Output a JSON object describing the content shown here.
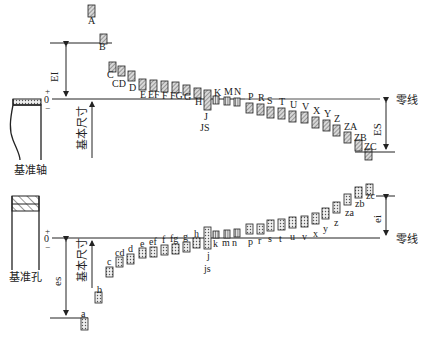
{
  "top": {
    "axis_label": "基准轴",
    "zero_line_label": "零线",
    "basic_size_label": "基本尺寸",
    "plus": "+",
    "zero": "0",
    "minus": "−",
    "EI_label": "EI",
    "ES_label": "ES",
    "hole_letters": [
      {
        "t": "A",
        "x": 88,
        "y": 5,
        "h": 12,
        "lx": 88,
        "ly": 24
      },
      {
        "t": "B",
        "x": 100,
        "y": 34,
        "h": 10,
        "lx": 99,
        "ly": 50
      },
      {
        "t": "C",
        "x": 109,
        "y": 62,
        "h": 10,
        "lx": 107,
        "ly": 78
      },
      {
        "t": "CD",
        "x": 118,
        "y": 66,
        "h": 10,
        "lx": 112,
        "ly": 87
      },
      {
        "t": "D",
        "x": 128,
        "y": 71,
        "h": 10,
        "lx": 129,
        "ly": 91
      },
      {
        "t": "E",
        "x": 139,
        "y": 79,
        "h": 11,
        "lx": 140,
        "ly": 98
      },
      {
        "t": "EF",
        "x": 150,
        "y": 80,
        "h": 11,
        "lx": 148,
        "ly": 98
      },
      {
        "t": "F",
        "x": 161,
        "y": 81,
        "h": 11,
        "lx": 162,
        "ly": 99
      },
      {
        "t": "FG",
        "x": 172,
        "y": 82,
        "h": 11,
        "lx": 170,
        "ly": 99
      },
      {
        "t": "G",
        "x": 183,
        "y": 85,
        "h": 10,
        "lx": 184,
        "ly": 100
      },
      {
        "t": "H",
        "x": 194,
        "y": 88,
        "h": 10,
        "lx": 195,
        "ly": 105
      }
    ],
    "J_label": "J",
    "JS_label": "JS",
    "K_label": "K",
    "M_label": "M",
    "N_label": "N",
    "right_letters": [
      {
        "t": "P",
        "x": 246,
        "y": 103,
        "h": 10,
        "lx": 248,
        "ly": 100
      },
      {
        "t": "R",
        "x": 257,
        "y": 104,
        "h": 11,
        "lx": 258,
        "ly": 101
      },
      {
        "t": "S",
        "x": 267,
        "y": 107,
        "h": 11,
        "lx": 267,
        "ly": 104
      },
      {
        "t": "T",
        "x": 278,
        "y": 108,
        "h": 11,
        "lx": 279,
        "ly": 105
      },
      {
        "t": "U",
        "x": 289,
        "y": 111,
        "h": 11,
        "lx": 290,
        "ly": 108
      },
      {
        "t": "V",
        "x": 301,
        "y": 112,
        "h": 11,
        "lx": 302,
        "ly": 110
      },
      {
        "t": "X",
        "x": 312,
        "y": 117,
        "h": 11,
        "lx": 313,
        "ly": 114
      },
      {
        "t": "Y",
        "x": 323,
        "y": 120,
        "h": 11,
        "lx": 324,
        "ly": 117
      },
      {
        "t": "Z",
        "x": 333,
        "y": 125,
        "h": 11,
        "lx": 334,
        "ly": 122
      },
      {
        "t": "ZA",
        "x": 344,
        "y": 132,
        "h": 11,
        "lx": 344,
        "ly": 130
      },
      {
        "t": "ZB",
        "x": 355,
        "y": 140,
        "h": 11,
        "lx": 354,
        "ly": 141
      },
      {
        "t": "ZC",
        "x": 365,
        "y": 149,
        "h": 11,
        "lx": 364,
        "ly": 150
      }
    ]
  },
  "bottom": {
    "axis_label": "基准孔",
    "zero_line_label": "零线",
    "basic_size_label": "基本尺寸",
    "plus": "+",
    "zero": "0",
    "minus": "−",
    "es_label": "es",
    "ei_label": "ei",
    "shaft_letters": [
      {
        "t": "a",
        "x": 81,
        "y": 318,
        "h": 12,
        "lx": 81,
        "ly": 317
      },
      {
        "t": "b",
        "x": 95,
        "y": 292,
        "h": 11,
        "lx": 97,
        "ly": 293
      },
      {
        "t": "c",
        "x": 106,
        "y": 267,
        "h": 10,
        "lx": 107,
        "ly": 265
      },
      {
        "t": "cd",
        "x": 116,
        "y": 257,
        "h": 10,
        "lx": 115,
        "ly": 256
      },
      {
        "t": "d",
        "x": 127,
        "y": 254,
        "h": 10,
        "lx": 128,
        "ly": 252
      },
      {
        "t": "e",
        "x": 139,
        "y": 248,
        "h": 10,
        "lx": 140,
        "ly": 247
      },
      {
        "t": "ef",
        "x": 150,
        "y": 247,
        "h": 10,
        "lx": 149,
        "ly": 245
      },
      {
        "t": "f",
        "x": 161,
        "y": 245,
        "h": 10,
        "lx": 162,
        "ly": 243
      },
      {
        "t": "fg",
        "x": 172,
        "y": 244,
        "h": 10,
        "lx": 170,
        "ly": 242
      },
      {
        "t": "g",
        "x": 183,
        "y": 242,
        "h": 10,
        "lx": 183,
        "ly": 240
      },
      {
        "t": "h",
        "x": 193,
        "y": 238,
        "h": 10,
        "lx": 194,
        "ly": 237
      }
    ],
    "j_label": "j",
    "js_label": "js",
    "k_label": "k",
    "m_label": "m",
    "n_label": "n",
    "right_letters": [
      {
        "t": "p",
        "x": 246,
        "y": 224,
        "h": 10,
        "lx": 248,
        "ly": 245
      },
      {
        "t": "r",
        "x": 257,
        "y": 224,
        "h": 10,
        "lx": 258,
        "ly": 244
      },
      {
        "t": "s",
        "x": 267,
        "y": 220,
        "h": 11,
        "lx": 268,
        "ly": 242
      },
      {
        "t": "t",
        "x": 278,
        "y": 219,
        "h": 11,
        "lx": 279,
        "ly": 242
      },
      {
        "t": "u",
        "x": 289,
        "y": 217,
        "h": 11,
        "lx": 290,
        "ly": 240
      },
      {
        "t": "v",
        "x": 301,
        "y": 216,
        "h": 11,
        "lx": 302,
        "ly": 240
      },
      {
        "t": "x",
        "x": 312,
        "y": 213,
        "h": 11,
        "lx": 313,
        "ly": 237
      },
      {
        "t": "y",
        "x": 322,
        "y": 208,
        "h": 11,
        "lx": 323,
        "ly": 232
      },
      {
        "t": "z",
        "x": 333,
        "y": 202,
        "h": 11,
        "lx": 334,
        "ly": 226
      },
      {
        "t": "za",
        "x": 344,
        "y": 194,
        "h": 11,
        "lx": 345,
        "ly": 216
      },
      {
        "t": "zb",
        "x": 355,
        "y": 187,
        "h": 11,
        "lx": 355,
        "ly": 207
      },
      {
        "t": "zc",
        "x": 366,
        "y": 184,
        "h": 11,
        "lx": 366,
        "ly": 199
      }
    ]
  }
}
